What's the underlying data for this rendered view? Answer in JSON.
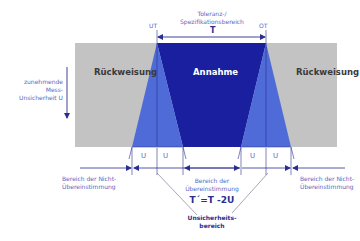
{
  "colors": {
    "rejection_gray": "#c3c3c3",
    "acceptance_blue": "#1a1fa0",
    "uncertainty_blue": "#4f6bd8",
    "line_blue": "#2a2f8f",
    "text_blue": "#5a68c4"
  },
  "top": {
    "tolerance_label_line1": "Toleranz-/",
    "tolerance_label_line2": "Spezifikationsbereich",
    "T": "T",
    "UT": "UT",
    "OT": "OT"
  },
  "left_axis": {
    "line1": "zunehmende",
    "line2": "Mess-",
    "line3": "Unsicherheit U",
    "arrow_icon": "arrow-down"
  },
  "regions": {
    "rejection_left": "Rückweisung",
    "acceptance": "Annahme",
    "rejection_right": "Rückweisung"
  },
  "u_labels": [
    "U",
    "U",
    "U",
    "U"
  ],
  "bottom": {
    "nonconformity_left_line1": "Bereich der Nicht-",
    "nonconformity_left_line2": "Übereinstimmung",
    "conformity_line1": "Bereich der",
    "conformity_line2": "Übereinstimmung",
    "formula": "T´=T -2U",
    "nonconformity_right_line1": "Bereich der Nicht-",
    "nonconformity_right_line2": "Übereinstimmung",
    "uncertainty_line1": "Unsicherheits-",
    "uncertainty_line2": "bereich"
  }
}
